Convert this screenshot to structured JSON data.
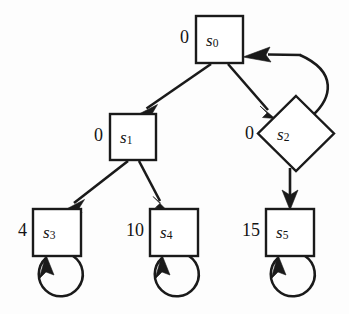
{
  "diagram": {
    "background_color": "#fdfdfd",
    "stroke_color": "#1a1a1a",
    "fill_color": "#ffffff",
    "nodes": [
      {
        "id": "s0",
        "label": "s",
        "subscript": "0",
        "shape": "square",
        "value": "0",
        "cx": 219.5,
        "cy": 39.5,
        "size": 47
      },
      {
        "id": "s1",
        "label": "s",
        "subscript": "1",
        "shape": "square",
        "value": "0",
        "cx": 132.5,
        "cy": 137,
        "size": 46
      },
      {
        "id": "s2",
        "label": "s",
        "subscript": "2",
        "shape": "diamond",
        "value": "0",
        "cx": 296,
        "cy": 133,
        "size": 74
      },
      {
        "id": "s3",
        "label": "s",
        "subscript": "3",
        "shape": "square",
        "value": "4",
        "cx": 57.5,
        "cy": 232.5,
        "size": 48
      },
      {
        "id": "s4",
        "label": "s",
        "subscript": "4",
        "shape": "square",
        "value": "10",
        "cx": 174,
        "cy": 232.5,
        "size": 48
      },
      {
        "id": "s5",
        "label": "s",
        "subscript": "5",
        "shape": "square",
        "value": "15",
        "cx": 290,
        "cy": 232.5,
        "size": 48
      }
    ],
    "edges": [
      {
        "from": "s0",
        "to": "s1",
        "kind": "straight"
      },
      {
        "from": "s0",
        "to": "s2",
        "kind": "straight"
      },
      {
        "from": "s1",
        "to": "s3",
        "kind": "straight"
      },
      {
        "from": "s1",
        "to": "s4",
        "kind": "straight"
      },
      {
        "from": "s2",
        "to": "s0",
        "kind": "curved"
      },
      {
        "from": "s2",
        "to": "s5",
        "kind": "straight"
      },
      {
        "from": "s3",
        "to": "s3",
        "kind": "self-loop"
      },
      {
        "from": "s4",
        "to": "s4",
        "kind": "self-loop"
      },
      {
        "from": "s5",
        "to": "s5",
        "kind": "self-loop"
      }
    ]
  }
}
